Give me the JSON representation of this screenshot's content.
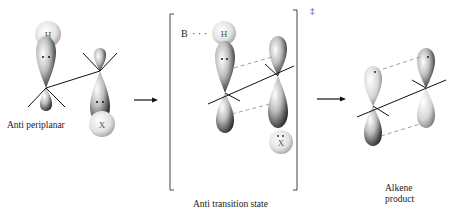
{
  "diagram": {
    "type": "reaction-mechanism",
    "stages": [
      {
        "id": "reactant",
        "label": "Anti periplanar",
        "atoms": [
          {
            "symbol": "H",
            "position": "top-left"
          },
          {
            "symbol": "X",
            "position": "bottom-right"
          }
        ]
      },
      {
        "id": "transition-state",
        "label": "Anti transition state",
        "superscript": "‡",
        "base_label": "B",
        "base_dots": "· · ·",
        "atoms": [
          {
            "symbol": "H",
            "position": "top-left"
          },
          {
            "symbol": "X",
            "position": "bottom-right"
          }
        ]
      },
      {
        "id": "product",
        "label_line1": "Alkene",
        "label_line2": "product"
      }
    ],
    "arrows": [
      {
        "from": "reactant",
        "to": "transition-state"
      },
      {
        "from": "transition-state",
        "to": "product"
      }
    ],
    "colors": {
      "lobe_light": "#f4f4f4",
      "lobe_dark": "#3a3a3a",
      "line": "#111111",
      "dashed": "#888888"
    }
  }
}
